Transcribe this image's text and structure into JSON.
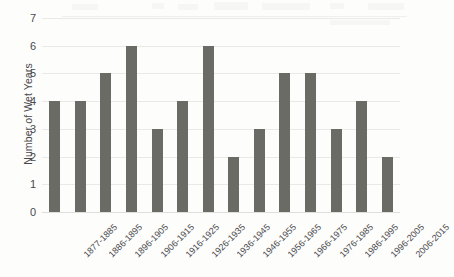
{
  "chart_data": {
    "type": "bar",
    "title": "",
    "xlabel": "",
    "ylabel": "Number of Wet Years",
    "categories": [
      "1877-1885",
      "1886-1895",
      "1896-1905",
      "1906-1915",
      "1916-1925",
      "1926-1935",
      "1936-1945",
      "1946-1955",
      "1956-1965",
      "1966-1975",
      "1976-1985",
      "1986-1995",
      "1996-2005",
      "2006-2015"
    ],
    "values": [
      4,
      4,
      5,
      6,
      3,
      4,
      6,
      2,
      3,
      5,
      5,
      3,
      4,
      2
    ],
    "ylim": [
      0,
      7
    ],
    "ytick_labels": [
      "0",
      "1",
      "2",
      "3",
      "4",
      "5",
      "6",
      "7"
    ],
    "ytick_values": [
      0,
      1,
      2,
      3,
      4,
      5,
      6,
      7
    ],
    "grid": "horizontal",
    "legend": "none",
    "bar_color": "#6b6b66",
    "gridline_color": "#e9e9e7",
    "background_color": "#fdfdfc",
    "text_color": "#4a4a4c",
    "xtick_rotation_degrees": -45
  }
}
